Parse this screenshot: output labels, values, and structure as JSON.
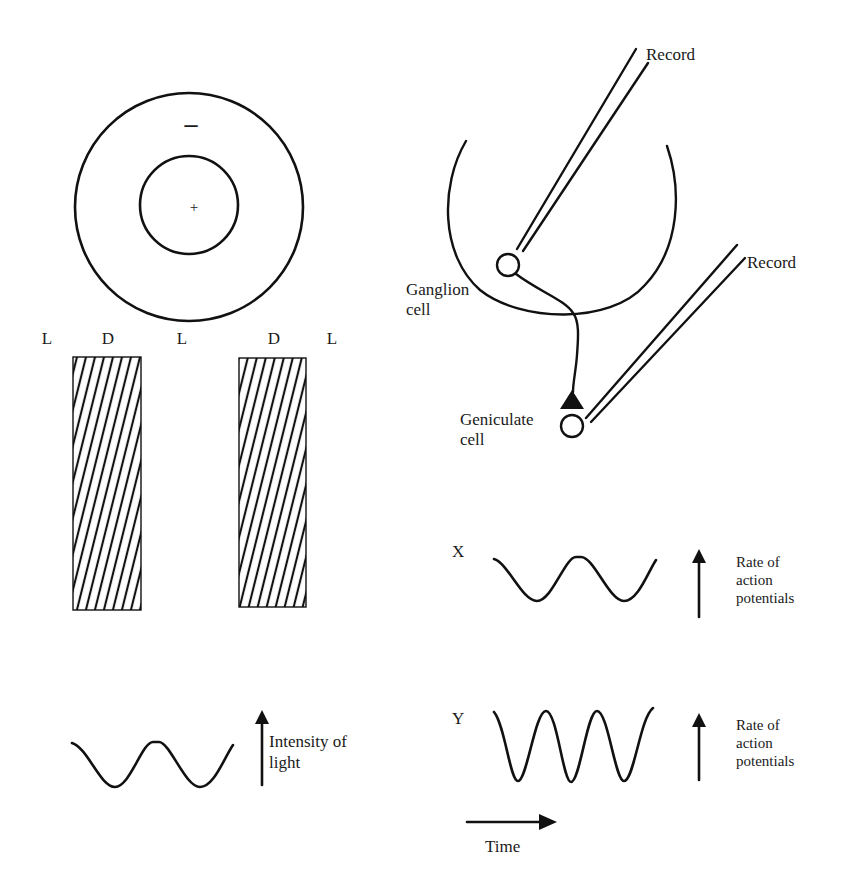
{
  "figure": {
    "receptive_field": {
      "surround_sign": "–",
      "center_sign": "+",
      "outer_circle": {
        "cx": 189,
        "cy": 207,
        "r": 114
      },
      "inner_circle": {
        "cx": 189,
        "cy": 205,
        "r": 49
      }
    },
    "grating_labels": [
      "L",
      "D",
      "L",
      "D",
      "L"
    ],
    "grating_bars": [
      {
        "name": "dark-bar-1",
        "x": 73,
        "y": 357,
        "w": 68,
        "h": 253
      },
      {
        "name": "dark-bar-2",
        "x": 239,
        "y": 358,
        "w": 67,
        "h": 249
      }
    ],
    "light_intensity_plot": {
      "arrow_label_line1": "Intensity of",
      "arrow_label_line2": "light"
    },
    "recording_setup": {
      "record_label_1": "Record",
      "record_label_2": "Record",
      "ganglion_label_line1": "Ganglion",
      "ganglion_label_line2": "cell",
      "geniculate_label_line1": "Geniculate",
      "geniculate_label_line2": "cell"
    },
    "response_x": {
      "label": "X",
      "arrow_label_line1": "Rate of",
      "arrow_label_line2": "action",
      "arrow_label_line3": "potentials"
    },
    "response_y": {
      "label": "Y",
      "arrow_label_line1": "Rate of",
      "arrow_label_line2": "action",
      "arrow_label_line3": "potentials"
    },
    "time_axis": {
      "label": "Time"
    },
    "colors": {
      "ink": "#111111",
      "background": "#ffffff"
    }
  }
}
